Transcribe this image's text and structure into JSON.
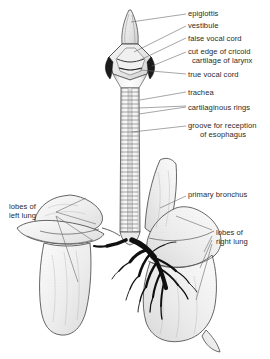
{
  "figure": {
    "background_color": "#ffffff",
    "ink_color": "#2b2b2b",
    "line_color": "#555555"
  },
  "labels": {
    "epiglottis": "epiglottis",
    "vestibule": "vestibule",
    "false_vocal_cord": "false vocal cord",
    "cricoid_line1": "cut edge of cricoid",
    "cricoid_line2": "cartilage of larynx",
    "true_vocal_cord": "true vocal cord",
    "trachea": "trachea",
    "cartilaginous_rings": "cartilaginous rings",
    "groove_line1": "groove for reception",
    "groove_line2": "of esophagus",
    "primary_bronchus": "primary bronchus",
    "lobes_left_line1": "lobes of",
    "lobes_left_line2": "left lung",
    "lobes_right_line1": "lobes of",
    "lobes_right_line2": "right lung"
  },
  "structures": [
    {
      "name": "epiglottis",
      "side": "midline"
    },
    {
      "name": "vestibule",
      "side": "midline"
    },
    {
      "name": "false-vocal-cord",
      "side": "midline"
    },
    {
      "name": "cricoid-cartilage",
      "side": "midline"
    },
    {
      "name": "true-vocal-cord",
      "side": "midline"
    },
    {
      "name": "trachea",
      "side": "midline"
    },
    {
      "name": "cartilaginous-rings",
      "side": "midline"
    },
    {
      "name": "esophageal-groove",
      "side": "midline"
    },
    {
      "name": "primary-bronchus",
      "side": "right"
    },
    {
      "name": "left-lung",
      "side": "left"
    },
    {
      "name": "right-lung",
      "side": "right"
    }
  ]
}
